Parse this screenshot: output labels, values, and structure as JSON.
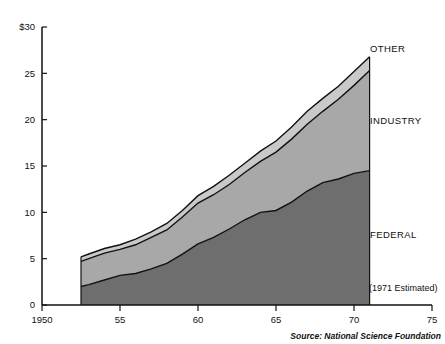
{
  "chart_data": {
    "type": "area",
    "title": "",
    "subtitle": "",
    "xlabel": "",
    "ylabel": "",
    "stacked": true,
    "grid": false,
    "legend_position": "right-inline",
    "xlim": [
      1950,
      1975
    ],
    "ylim": [
      0,
      30
    ],
    "x_ticks": [
      1950,
      1955,
      1960,
      1965,
      1970,
      1975
    ],
    "x_tick_labels": [
      "1950",
      "55",
      "60",
      "65",
      "70",
      "75"
    ],
    "y_ticks": [
      0,
      5,
      10,
      15,
      20,
      25,
      30
    ],
    "y_tick_labels": [
      "0",
      "5",
      "10",
      "15",
      "20",
      "25",
      "$30"
    ],
    "x": [
      1952.5,
      1953,
      1954,
      1955,
      1956,
      1957,
      1958,
      1959,
      1960,
      1961,
      1962,
      1963,
      1964,
      1965,
      1966,
      1967,
      1968,
      1969,
      1970,
      1971
    ],
    "series": [
      {
        "name": "FEDERAL",
        "color": "#6e6e6e",
        "values": [
          2.0,
          2.2,
          2.7,
          3.2,
          3.4,
          3.9,
          4.5,
          5.5,
          6.6,
          7.3,
          8.2,
          9.2,
          10.0,
          10.2,
          11.1,
          12.3,
          13.2,
          13.6,
          14.2,
          14.5
        ]
      },
      {
        "name": "INDUSTRY",
        "color": "#a8a8a8",
        "values": [
          2.7,
          2.8,
          2.9,
          2.8,
          3.1,
          3.4,
          3.6,
          4.0,
          4.4,
          4.6,
          4.8,
          5.1,
          5.5,
          6.3,
          6.8,
          7.2,
          7.7,
          8.6,
          9.5,
          10.8
        ]
      },
      {
        "name": "OTHER",
        "color": "#c9c9c9",
        "values": [
          0.5,
          0.5,
          0.5,
          0.5,
          0.6,
          0.6,
          0.7,
          0.7,
          0.8,
          0.9,
          1.0,
          1.0,
          1.1,
          1.2,
          1.3,
          1.4,
          1.4,
          1.4,
          1.5,
          1.5
        ]
      }
    ],
    "totals": [
      5.2,
      5.5,
      6.1,
      6.5,
      7.1,
      7.9,
      8.8,
      10.2,
      11.8,
      12.8,
      14.0,
      15.3,
      16.6,
      17.7,
      19.2,
      20.9,
      22.3,
      23.6,
      25.2,
      26.8
    ],
    "annotations": [
      {
        "id": "estimate-note",
        "text": "(1971 Estimated)"
      }
    ],
    "band_labels": [
      {
        "id": "other",
        "text": "OTHER"
      },
      {
        "id": "industry",
        "text": "INDUSTRY"
      },
      {
        "id": "federal",
        "text": "FEDERAL"
      }
    ]
  },
  "source": {
    "text": "Source: National Science Foundation"
  }
}
